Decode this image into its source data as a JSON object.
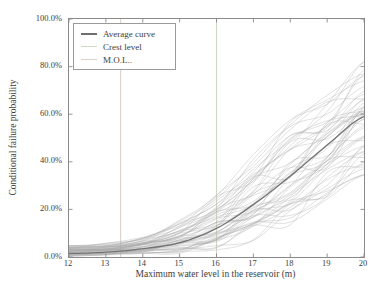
{
  "figure": {
    "background": "#ffffff",
    "border_color": "#8a8a8a",
    "text_color": "#3d3d3d"
  },
  "legend": {
    "items": [
      {
        "label": "Average curve",
        "color": "#6e6e6e",
        "line_width": 2
      },
      {
        "label": "Crest level",
        "color": "#cfd8c3",
        "line_width": 1.5
      },
      {
        "label": "M.O.L..",
        "color": "#ddd2c8",
        "line_width": 1.5
      }
    ]
  },
  "chart_data": {
    "type": "line",
    "title": "",
    "xlabel": "Maximum water level in the reservoir (m)",
    "ylabel": "Conditional failure probability",
    "xlim": [
      12,
      20
    ],
    "ylim": [
      0,
      100
    ],
    "grid": false,
    "legend_position": "upper-left",
    "x_ticks": [
      {
        "value": 12,
        "label": "12"
      },
      {
        "value": 13,
        "label": "13"
      },
      {
        "value": 14,
        "label": "14"
      },
      {
        "value": 15,
        "label": "15"
      },
      {
        "value": 16,
        "label": "16"
      },
      {
        "value": 17,
        "label": "17"
      },
      {
        "value": 18,
        "label": "18"
      },
      {
        "value": 19,
        "label": "19"
      },
      {
        "value": 20,
        "label": "20"
      }
    ],
    "y_ticks": [
      {
        "value": 0,
        "label": "0.0%"
      },
      {
        "value": 20,
        "label": "20.0%"
      },
      {
        "value": 40,
        "label": "40.0%"
      },
      {
        "value": 60,
        "label": "60.0%"
      },
      {
        "value": 80,
        "label": "80.0%"
      },
      {
        "value": 100,
        "label": "100.0%"
      }
    ],
    "series": {
      "average_curve": {
        "name": "Average curve",
        "x": [
          12,
          13,
          14,
          15,
          16,
          17,
          18,
          19,
          20
        ],
        "values": [
          1.5,
          2.0,
          3.5,
          6.0,
          12,
          22,
          34,
          47,
          59
        ],
        "color": "#6e6e6e",
        "width": 1.3
      },
      "crest_level": {
        "name": "Crest level",
        "x": 16.0,
        "orientation": "vertical",
        "color": "#cfd8c3",
        "width": 1.1
      },
      "mol": {
        "name": "M.O.L..",
        "x": 13.4,
        "orientation": "vertical",
        "color": "#ddd2c8",
        "width": 1.1
      },
      "monte_carlo_ensemble": {
        "name": "Monte Carlo fragility curves",
        "count": 50,
        "seed": 11,
        "x": [
          12,
          13,
          14,
          15,
          16,
          17,
          18,
          19,
          20
        ],
        "min": [
          0.4,
          0.7,
          1.0,
          1.6,
          3.0,
          7.0,
          13.5,
          23.5,
          34.5
        ],
        "max": [
          4.8,
          5.8,
          8.5,
          15.5,
          27,
          43,
          57.5,
          70.5,
          82
        ],
        "color": "#aaaaaa",
        "width": 0.7,
        "opacity": 0.5
      }
    }
  }
}
